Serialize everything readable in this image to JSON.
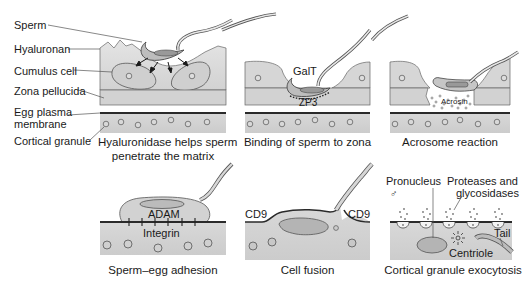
{
  "colors": {
    "matrix_fill": "#d9d9d9",
    "cell_fill": "#c8c8c8",
    "zona_fill": "#cfcfcf",
    "egg_fill": "#d4d4d4",
    "membrane": "#2a2a2a",
    "line": "#555555"
  },
  "panels": [
    {
      "id": "hyaluronidase",
      "caption_line1": "Hyaluronidase helps sperm",
      "caption_line2": "penetrate the matrix",
      "labels": {
        "sperm": "Sperm",
        "hyaluronan": "Hyaluronan",
        "cumulus_cell": "Cumulus cell",
        "zona_pellucida": "Zona pellucida",
        "egg_plasma_membrane_line1": "Egg plasma",
        "egg_plasma_membrane_line2": "membrane",
        "cortical_granule": "Cortical granule"
      }
    },
    {
      "id": "binding",
      "caption": "Binding of sperm to zona",
      "labels": {
        "galt": "GalT",
        "zp3": "ZP3"
      }
    },
    {
      "id": "acrosome",
      "caption": "Acrosome reaction",
      "labels": {
        "acrosin": "Acrosin"
      }
    },
    {
      "id": "adhesion",
      "caption": "Sperm–egg adhesion",
      "labels": {
        "adam": "ADAM",
        "integrin": "Integrin"
      }
    },
    {
      "id": "fusion",
      "caption": "Cell fusion",
      "labels": {
        "cd9_left": "CD9",
        "cd9_right": "CD9"
      }
    },
    {
      "id": "exocytosis",
      "caption": "Cortical granule exocytosis",
      "labels": {
        "pronucleus": "Pronucleus",
        "male_symbol": "♂",
        "proteases_line1": "Proteases and",
        "proteases_line2": "glycosidases",
        "tail": "Tail",
        "centriole": "Centriole"
      }
    }
  ]
}
